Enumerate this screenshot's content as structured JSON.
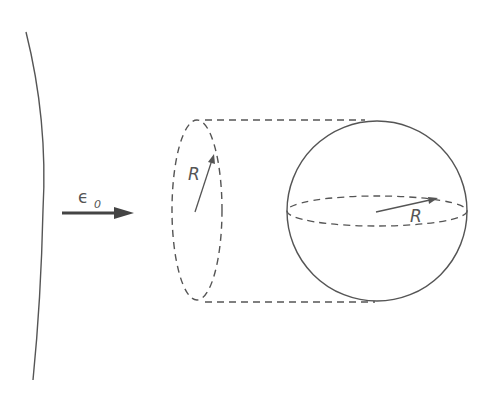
{
  "diagram": {
    "field_label": "ϵ",
    "field_subscript": "0",
    "cylinder_radius_label": "R",
    "sphere_radius_label": "R",
    "colors": {
      "stroke": "#555555",
      "arrow": "#444444",
      "background": "#ffffff"
    }
  }
}
